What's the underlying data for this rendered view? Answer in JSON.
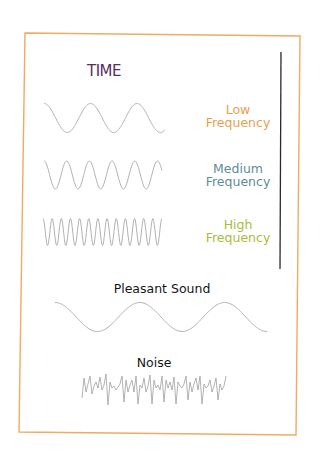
{
  "title": "TIME",
  "colors": {
    "frame_border": "#efab62",
    "divider_line": "#2a2a2a",
    "wave_stroke": "#a8a8a8",
    "title": "#5a2e5e",
    "low": "#e8a050",
    "medium": "#5f8c98",
    "high": "#a8bc3c",
    "label_dark": "#151515"
  },
  "frequencies": [
    {
      "name": "low",
      "line1": "Low",
      "line2": "Frequency",
      "cycles": 2.6
    },
    {
      "name": "medium",
      "line1": "Medium",
      "line2": "Frequency",
      "cycles": 5.2
    },
    {
      "name": "high",
      "line1": "High",
      "line2": "Frequency",
      "cycles": 13
    }
  ],
  "bottom": {
    "pleasant_label": "Pleasant Sound",
    "noise_label": "Noise"
  }
}
